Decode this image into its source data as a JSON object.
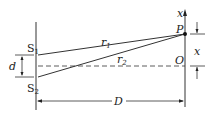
{
  "diagram": {
    "type": "double-slit interference",
    "labels": {
      "slit1": "S",
      "slit1_sub": "1",
      "slit2": "S",
      "slit2_sub": "2",
      "slit_separation": "d",
      "path1": "r",
      "path1_sub": "1",
      "path2": "r",
      "path2_sub": "2",
      "point": "P",
      "origin": "O",
      "axis": "x",
      "offset": "x",
      "distance": "D"
    }
  }
}
